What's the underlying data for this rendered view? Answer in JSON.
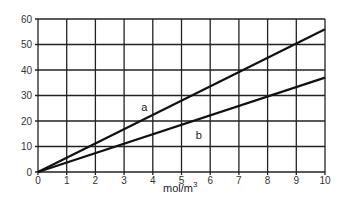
{
  "chart_data": {
    "type": "line",
    "title": "",
    "xlabel": "mol/m3",
    "xlabel_base": "mol/m",
    "xlabel_sup": "3",
    "ylabel": "",
    "xlim": [
      0,
      10
    ],
    "ylim": [
      0,
      60
    ],
    "x_ticks": [
      0,
      1,
      2,
      3,
      4,
      5,
      6,
      7,
      8,
      9,
      10
    ],
    "y_ticks": [
      0,
      10,
      20,
      30,
      40,
      50,
      60
    ],
    "grid": true,
    "legend": "none",
    "series": [
      {
        "name": "a",
        "x": [
          0,
          10
        ],
        "values": [
          0,
          56
        ]
      },
      {
        "name": "b",
        "x": [
          0,
          10
        ],
        "values": [
          0,
          37
        ]
      }
    ],
    "annotations": [
      {
        "text": "a",
        "x": 3.7,
        "y": 24
      },
      {
        "text": "b",
        "x": 5.6,
        "y": 13
      }
    ]
  }
}
